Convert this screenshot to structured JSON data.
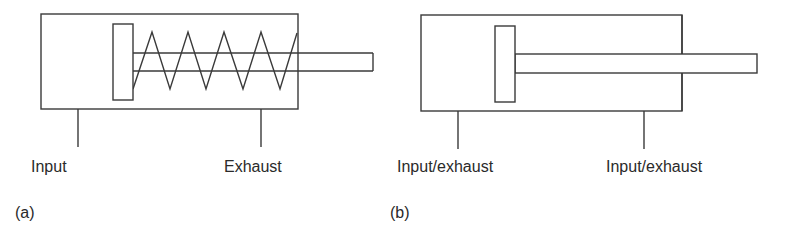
{
  "diagrams": [
    {
      "id": "a",
      "caption": "(a)",
      "type": "single-acting cylinder with spring return",
      "ports": [
        {
          "label": "Input"
        },
        {
          "label": "Exhaust"
        }
      ]
    },
    {
      "id": "b",
      "caption": "(b)",
      "type": "double-acting cylinder",
      "ports": [
        {
          "label": "Input/exhaust"
        },
        {
          "label": "Input/exhaust"
        }
      ]
    }
  ],
  "colors": {
    "line": "#3a3a3a",
    "text": "#2a2a2a",
    "background": "#ffffff"
  }
}
